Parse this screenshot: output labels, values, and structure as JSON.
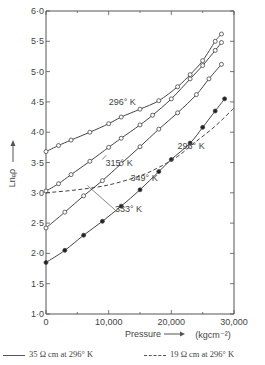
{
  "chart_data": {
    "type": "line",
    "title": "",
    "xlabel": "Pressure",
    "xunit": "(kgcm⁻²)",
    "ylabel": "Lnₑρ",
    "xlim": [
      0,
      30000
    ],
    "ylim": [
      1.0,
      6.0
    ],
    "x_ticks": [
      "0",
      "10,000",
      "20,000",
      "30,000"
    ],
    "y_ticks": [
      "1·0",
      "1·5",
      "2·0",
      "2·5",
      "3·0",
      "3·5",
      "4·0",
      "4·5",
      "5·0",
      "5·5",
      "6·0"
    ],
    "grid": false,
    "series": [
      {
        "name": "296° K (35 Ω cm)",
        "style": "solid",
        "marker": "open-circle",
        "x": [
          0,
          2000,
          4000,
          7000,
          10000,
          12000,
          15000,
          18000,
          21000,
          23000,
          25000,
          27000,
          28000
        ],
        "y": [
          3.68,
          3.78,
          3.87,
          4.0,
          4.14,
          4.25,
          4.38,
          4.52,
          4.75,
          4.95,
          5.18,
          5.5,
          5.62
        ]
      },
      {
        "name": "315° K",
        "style": "solid",
        "marker": "open-circle",
        "x": [
          0,
          2000,
          4000,
          7000,
          10000,
          12000,
          15000,
          17000,
          20000,
          23000,
          25000,
          27000,
          28000
        ],
        "y": [
          3.03,
          3.15,
          3.3,
          3.52,
          3.75,
          3.9,
          4.12,
          4.28,
          4.55,
          4.88,
          5.1,
          5.35,
          5.48
        ]
      },
      {
        "name": "349° K",
        "style": "solid",
        "marker": "open-circle",
        "x": [
          0,
          3000,
          6000,
          9000,
          12000,
          15000,
          18000,
          21000,
          24000,
          26000,
          28000
        ],
        "y": [
          2.42,
          2.68,
          2.95,
          3.2,
          3.48,
          3.76,
          4.05,
          4.32,
          4.62,
          4.88,
          5.12
        ]
      },
      {
        "name": "333° K",
        "style": "solid",
        "marker": "filled-circle",
        "x": [
          0,
          3000,
          6000,
          9000,
          12000,
          15000,
          18000,
          20000,
          23000,
          25000,
          27000,
          28500
        ],
        "y": [
          1.85,
          2.05,
          2.3,
          2.53,
          2.78,
          3.05,
          3.35,
          3.55,
          3.82,
          4.08,
          4.35,
          4.55
        ]
      },
      {
        "name": "296° K (19 Ω cm)",
        "style": "dashed",
        "marker": "none",
        "x": [
          0,
          5000,
          10000,
          15000,
          18000,
          21000,
          24000,
          27000,
          30000
        ],
        "y": [
          3.0,
          3.05,
          3.13,
          3.28,
          3.42,
          3.6,
          3.85,
          4.1,
          4.4
        ]
      }
    ],
    "annotations": [
      {
        "text": "296° K",
        "x": 10000,
        "y": 4.45
      },
      {
        "text": "315° K",
        "x": 9500,
        "y": 3.45
      },
      {
        "text": "296° K",
        "x": 21000,
        "y": 3.72
      },
      {
        "text": "349° K",
        "x": 13500,
        "y": 3.2
      },
      {
        "text": "333° K",
        "x": 11000,
        "y": 2.68
      }
    ],
    "legend": [
      {
        "label": "35 Ω cm at 296° K",
        "style": "solid"
      },
      {
        "label": "19 Ω cm at 296° K",
        "style": "dashed"
      }
    ],
    "legend_position": "bottom"
  }
}
